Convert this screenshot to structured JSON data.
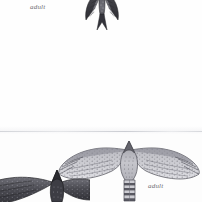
{
  "page": {
    "kind": "field-guide-plate",
    "background_color": "#fefefe",
    "width": 202,
    "height": 202
  },
  "seam": {
    "name": "page-fold-seam",
    "y": 131,
    "color": "#cdcfd4"
  },
  "figures": [
    {
      "id": "top-raptor",
      "caption": "adult",
      "view": "ventral",
      "tone": "dark",
      "cropped": "top",
      "body_color": "#3a3a3c",
      "wing_color": "#54545a",
      "x": 84,
      "y": -16,
      "width": 36,
      "height": 50
    },
    {
      "id": "lower-hawk",
      "caption": "adult",
      "view": "ventral",
      "tone": "light",
      "cropped": "none",
      "body_color": "#8d8d94",
      "wing_color": "#a8a8ae",
      "x": 56,
      "y": 136,
      "width": 146,
      "height": 66
    },
    {
      "id": "lower-dark-hawk",
      "caption": "",
      "view": "dorsal",
      "tone": "dark",
      "cropped": "left",
      "body_color": "#3f3f44",
      "wing_color": "#55555b",
      "x": -34,
      "y": 168,
      "width": 124,
      "height": 40
    }
  ],
  "labels": {
    "top": "adult",
    "bottom": "adult"
  },
  "colors": {
    "paper": "#fefefe",
    "ink_dark": "#2e2e31",
    "ink_mid": "#6f6f76",
    "ink_light": "#b3b3b9",
    "label_text": "#6e6e72",
    "seam_line": "#cdcfd4"
  }
}
